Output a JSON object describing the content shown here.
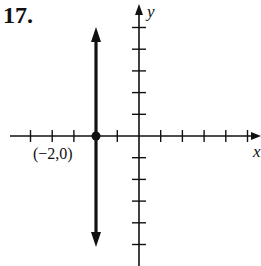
{
  "problem_number": "17.",
  "axes": {
    "x_label": "x",
    "y_label": "y",
    "x_ticks": [
      -5,
      -4,
      -3,
      -2,
      -1,
      1,
      2,
      3,
      4,
      5
    ],
    "y_ticks": [
      -5,
      -4,
      -3,
      -2,
      -1,
      1,
      2,
      3,
      4,
      5
    ]
  },
  "graph": {
    "type": "vertical-line",
    "equation": "x = -2",
    "point": {
      "x": -2,
      "y": 0,
      "label": "(−2,0)"
    }
  },
  "colors": {
    "ink": "#111111",
    "background": "#ffffff"
  }
}
